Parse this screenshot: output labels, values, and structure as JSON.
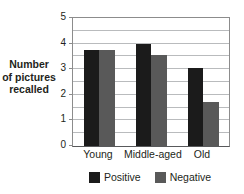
{
  "chart_data": {
    "type": "bar",
    "title": "",
    "xlabel": "",
    "ylabel": "Number of pictures recalled",
    "ylabel_lines": [
      "Number",
      "of pictures",
      "recalled"
    ],
    "categories": [
      "Young",
      "Middle-aged",
      "Old"
    ],
    "series": [
      {
        "name": "Positive",
        "color": "#1b1b1b",
        "values": [
          3.75,
          4.0,
          3.05
        ]
      },
      {
        "name": "Negative",
        "color": "#595959",
        "values": [
          3.75,
          3.55,
          1.7
        ]
      }
    ],
    "ylim": [
      0,
      5
    ],
    "y_ticks": [
      0,
      1,
      2,
      3,
      4,
      5
    ],
    "y_tick_labels": [
      "0",
      "1",
      "2",
      "3",
      "4",
      "5"
    ],
    "grid": true,
    "grid_interval": 0.5,
    "grid_color": "#b9bbbd",
    "legend_position": "bottom",
    "legend": [
      {
        "label": "Positive",
        "color": "#1b1b1b"
      },
      {
        "label": "Negative",
        "color": "#595959"
      }
    ]
  }
}
